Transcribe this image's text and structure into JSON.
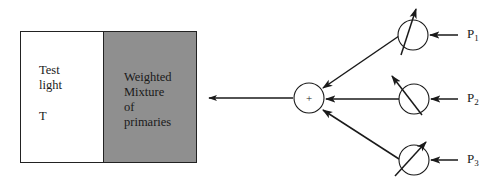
{
  "diagram": {
    "type": "color-matching-experiment",
    "box": {
      "left_panel": {
        "line1": "Test",
        "line2": "light",
        "symbol": "T",
        "fill": "#ffffff"
      },
      "right_panel": {
        "line1": "Weighted",
        "line2": "Mixture",
        "line3": "of",
        "line4": "primaries",
        "fill": "#8f8f8f"
      }
    },
    "summing_node": {
      "symbol": "+"
    },
    "primaries": [
      {
        "name": "P",
        "index": "1"
      },
      {
        "name": "P",
        "index": "2"
      },
      {
        "name": "P",
        "index": "3"
      }
    ],
    "line_color": "#1a1a1a"
  }
}
